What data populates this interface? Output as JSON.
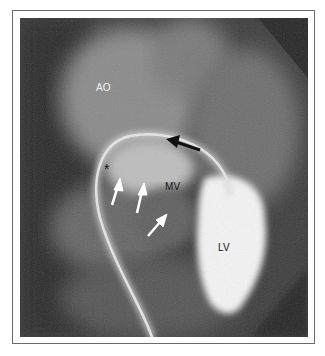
{
  "figure": {
    "labels": {
      "aorta": "AO",
      "mitral_valve": "MV",
      "left_ventricle": "LV",
      "asterisk": "*"
    },
    "arrows": {
      "black": 1,
      "white": 3
    },
    "colors": {
      "background": "#3a3a3a",
      "contrast": "#f4f4f4",
      "frame_border": "#6a6a6a"
    }
  }
}
